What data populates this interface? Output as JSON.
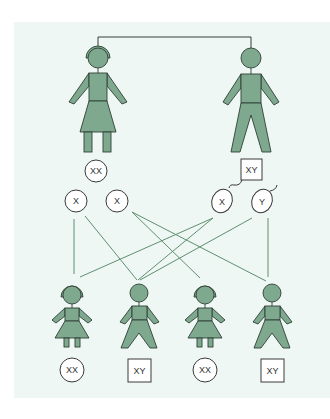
{
  "diagram": {
    "title": "",
    "colors": {
      "background_panel": "#eef7f4",
      "figure_fill": "#7fa98f",
      "figure_outline": "#2f3f36",
      "gamete_lines": "#5f8f70",
      "connector": "#3a3a3a"
    },
    "parents": {
      "mother": {
        "role": "female",
        "genotype": "XX",
        "genotype_shape": "circle",
        "gametes": [
          "X",
          "X"
        ]
      },
      "father": {
        "role": "male",
        "genotype": "XY",
        "genotype_shape": "square",
        "gametes": [
          "X",
          "Y"
        ],
        "gamete_type": "sperm"
      }
    },
    "children": [
      {
        "role": "female",
        "genotype": "XX",
        "genotype_shape": "circle",
        "from": [
          "mother X1",
          "father X"
        ]
      },
      {
        "role": "male",
        "genotype": "XY",
        "genotype_shape": "square",
        "from": [
          "mother X1",
          "father Y"
        ]
      },
      {
        "role": "female",
        "genotype": "XX",
        "genotype_shape": "circle",
        "from": [
          "mother X2",
          "father X"
        ]
      },
      {
        "role": "male",
        "genotype": "XY",
        "genotype_shape": "square",
        "from": [
          "mother X2",
          "father Y"
        ]
      }
    ]
  }
}
